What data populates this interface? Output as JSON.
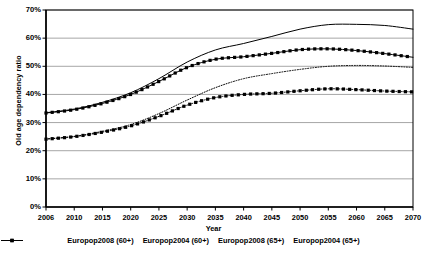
{
  "chart_data": {
    "type": "line",
    "title": "",
    "xlabel": "Year",
    "ylabel": "Old age dependency ratio",
    "xlim": [
      2006,
      2070
    ],
    "ylim": [
      0,
      0.7
    ],
    "grid": "horizontal",
    "legend_position": "bottom",
    "x_tick_labels": [
      "2006",
      "2010",
      "2015",
      "2020",
      "2025",
      "2030",
      "2035",
      "2040",
      "2045",
      "2050",
      "2055",
      "2060",
      "2065",
      "2070"
    ],
    "x_tick_values": [
      2006,
      2010,
      2015,
      2020,
      2025,
      2030,
      2035,
      2040,
      2045,
      2050,
      2055,
      2060,
      2065,
      2070
    ],
    "y_tick_labels": [
      "0%",
      "10%",
      "20%",
      "30%",
      "40%",
      "50%",
      "60%",
      "70%"
    ],
    "y_tick_values": [
      0,
      10,
      20,
      30,
      40,
      50,
      60,
      70
    ],
    "x": [
      2006,
      2010,
      2015,
      2020,
      2025,
      2030,
      2035,
      2040,
      2045,
      2050,
      2055,
      2060,
      2065,
      2070
    ],
    "series": [
      {
        "name": "Europop2008 (60+)",
        "style": "solid",
        "marker": "none",
        "color": "#000000",
        "values": [
          33.5,
          34.8,
          37.2,
          40.6,
          45.6,
          51.5,
          55.8,
          58.1,
          60.6,
          63.2,
          64.8,
          64.9,
          64.5,
          63.2
        ]
      },
      {
        "name": "Europop2004 (60+)",
        "style": "solid-marker",
        "marker": "square",
        "color": "#000000",
        "values": [
          33.4,
          34.6,
          36.8,
          40.0,
          44.6,
          49.6,
          52.5,
          53.4,
          54.6,
          55.9,
          56.2,
          55.6,
          54.5,
          53.2
        ]
      },
      {
        "name": "Europop2008 (65+)",
        "style": "dotted",
        "marker": "none",
        "color": "#000000",
        "values": [
          24.2,
          25.1,
          26.9,
          29.3,
          33.2,
          38.0,
          42.4,
          45.6,
          47.4,
          48.9,
          50.0,
          50.3,
          50.1,
          49.6
        ]
      },
      {
        "name": "Europop2004 (65+)",
        "style": "dash-dot-marker",
        "marker": "square",
        "color": "#000000",
        "values": [
          24.1,
          25.0,
          26.6,
          28.8,
          32.2,
          36.2,
          38.9,
          40.0,
          40.4,
          41.3,
          42.0,
          41.7,
          41.2,
          40.9
        ]
      }
    ]
  },
  "axes": {
    "y_title": "Old age dependency ratio",
    "x_title": "Year"
  },
  "legend": {
    "items": [
      {
        "label": "Europop2008 (60+)",
        "swatch": "line-solid-icon"
      },
      {
        "label": "Europop2004 (60+)",
        "swatch": "line-solid-square-icon"
      },
      {
        "label": "Europop2008 (65+)",
        "swatch": "line-dotted-icon"
      },
      {
        "label": "Europop2004 (65+)",
        "swatch": "line-dashdot-square-icon"
      }
    ]
  }
}
